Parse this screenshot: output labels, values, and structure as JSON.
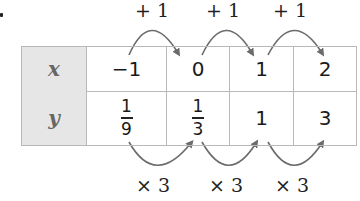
{
  "exercise_marker": ".",
  "table": {
    "rows": [
      {
        "header": "x",
        "values": [
          "−1",
          "0",
          "1",
          "2"
        ]
      },
      {
        "header": "y",
        "values": [
          {
            "type": "fraction",
            "num": "1",
            "den": "9"
          },
          {
            "type": "fraction",
            "num": "1",
            "den": "3"
          },
          "1",
          "3"
        ]
      }
    ]
  },
  "top_labels": [
    "+ 1",
    "+ 1",
    "+ 1"
  ],
  "bottom_labels": [
    "× 3",
    "× 3",
    "× 3"
  ],
  "colors": {
    "arrow": "#6b6b6b",
    "header_bg": "#e6e6e6",
    "border": "#b8b8b8"
  }
}
